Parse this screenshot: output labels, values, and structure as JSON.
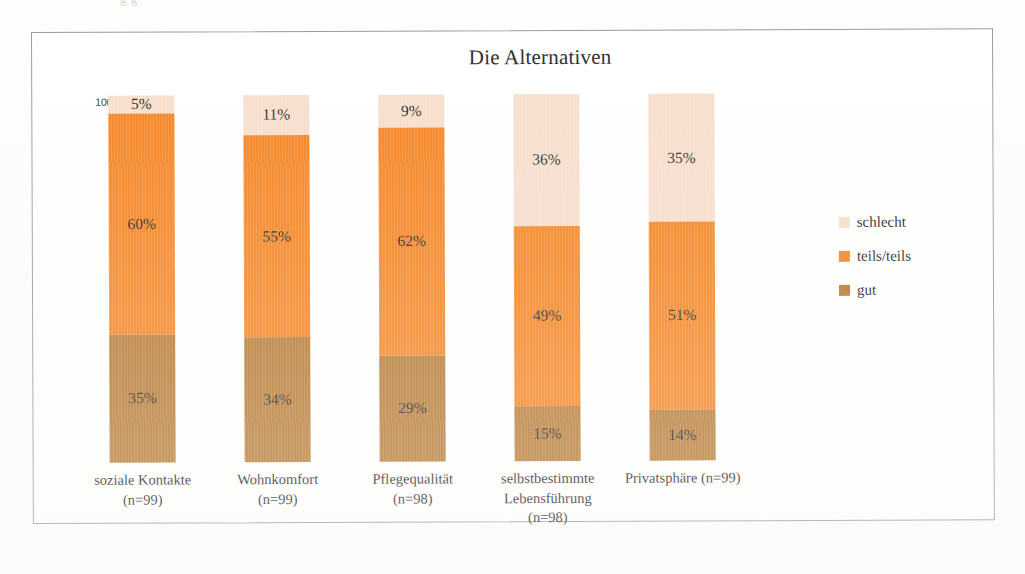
{
  "page": {
    "cut_off_text_above": "g g"
  },
  "chart": {
    "title": "Die Alternativen",
    "axis_max_label": "100%",
    "legend": {
      "items": [
        {
          "label": "schlecht",
          "color": "#f7ddcb"
        },
        {
          "label": "teils/teils",
          "color": "#f5821f"
        },
        {
          "label": "gut",
          "color": "#b5762e"
        }
      ]
    },
    "categories": [
      {
        "name": "soziale Kontakte",
        "n": "(n=99)",
        "label": "soziale Kontakte\n(n=99)"
      },
      {
        "name": "Wohnkomfort",
        "n": "(n=99)",
        "label": "Wohnkomfort\n(n=99)"
      },
      {
        "name": "Pflegequalität",
        "n": "(n=98)",
        "label": "Pflegequalität\n(n=98)"
      },
      {
        "name": "selbstbestimmte Lebensführung",
        "n": "(n=98)",
        "label": "selbstbestimmte\nLebensführung\n(n=98)"
      },
      {
        "name": "Privatsphäre",
        "n": "(n=99)",
        "label": "Privatsphäre (n=99)"
      }
    ],
    "bars": [
      {
        "category": "soziale Kontakte",
        "segments": [
          {
            "series": "schlecht",
            "value": 5,
            "label": "5%"
          },
          {
            "series": "teils/teils",
            "value": 60,
            "label": "60%"
          },
          {
            "series": "gut",
            "value": 35,
            "label": "35%"
          }
        ]
      },
      {
        "category": "Wohnkomfort",
        "segments": [
          {
            "series": "schlecht",
            "value": 11,
            "label": "11%"
          },
          {
            "series": "teils/teils",
            "value": 55,
            "label": "55%"
          },
          {
            "series": "gut",
            "value": 34,
            "label": "34%"
          }
        ]
      },
      {
        "category": "Pflegequalität",
        "segments": [
          {
            "series": "schlecht",
            "value": 9,
            "label": "9%"
          },
          {
            "series": "teils/teils",
            "value": 62,
            "label": "62%"
          },
          {
            "series": "gut",
            "value": 29,
            "label": "29%"
          }
        ]
      },
      {
        "category": "selbstbestimmte Lebensführung",
        "segments": [
          {
            "series": "schlecht",
            "value": 36,
            "label": "36%"
          },
          {
            "series": "teils/teils",
            "value": 49,
            "label": "49%"
          },
          {
            "series": "gut",
            "value": 15,
            "label": "15%"
          }
        ]
      },
      {
        "category": "Privatsphäre",
        "segments": [
          {
            "series": "schlecht",
            "value": 35,
            "label": "35%"
          },
          {
            "series": "teils/teils",
            "value": 51,
            "label": "51%"
          },
          {
            "series": "gut",
            "value": 14,
            "label": "14%"
          }
        ]
      }
    ]
  },
  "chart_data": {
    "type": "bar",
    "stacked": true,
    "stack_mode": "percent",
    "title": "Die Alternativen",
    "subtitle": "",
    "xlabel": "",
    "ylabel": "",
    "ylim": [
      0,
      100
    ],
    "grid": false,
    "legend_position": "right",
    "categories": [
      "soziale Kontakte (n=99)",
      "Wohnkomfort (n=99)",
      "Pflegequalität (n=98)",
      "selbstbestimmte Lebensführung (n=98)",
      "Privatsphäre (n=99)"
    ],
    "series": [
      {
        "name": "gut",
        "color": "#b5762e",
        "values": [
          35,
          34,
          29,
          15,
          14
        ]
      },
      {
        "name": "teils/teils",
        "color": "#f5821f",
        "values": [
          60,
          55,
          62,
          49,
          51
        ]
      },
      {
        "name": "schlecht",
        "color": "#f7ddcb",
        "values": [
          5,
          11,
          9,
          36,
          35
        ]
      }
    ],
    "tick_labels": {
      "y": [
        "100%"
      ]
    },
    "annotations": [
      "5%",
      "60%",
      "35%",
      "11%",
      "55%",
      "34%",
      "9%",
      "62%",
      "29%",
      "36%",
      "49%",
      "15%",
      "35%",
      "51%",
      "14%"
    ]
  }
}
